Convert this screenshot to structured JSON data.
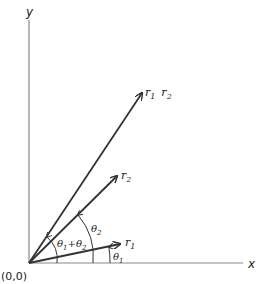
{
  "diagram": {
    "type": "vector-multiplication-polar",
    "axes": {
      "x_label": "x",
      "y_label": "y",
      "origin_label": "(0,0)"
    },
    "vectors": [
      {
        "id": "r1",
        "label_main": "r",
        "label_sub": "1"
      },
      {
        "id": "r2",
        "label_main": "r",
        "label_sub": "2"
      },
      {
        "id": "product",
        "label_main1": "r",
        "label_sub1": "1",
        "label_main2": "r",
        "label_sub2": "2"
      }
    ],
    "angles": [
      {
        "id": "theta1",
        "label_main": "θ",
        "label_sub": "1"
      },
      {
        "id": "theta2",
        "label_main": "θ",
        "label_sub": "2"
      },
      {
        "id": "theta-sum",
        "a_main": "θ",
        "a_sub": "1",
        "op": "+",
        "b_main": "θ",
        "b_sub": "2"
      }
    ]
  }
}
